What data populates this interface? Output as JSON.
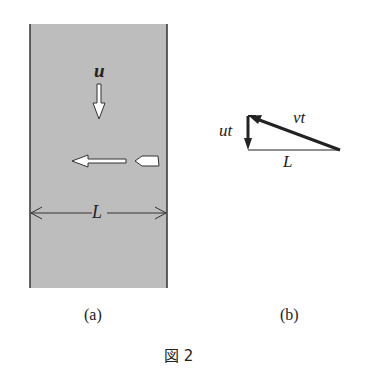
{
  "figure": {
    "caption": "図 2",
    "panel_a": {
      "label": "(a)",
      "current_label": "u",
      "width_label": "L",
      "river_color": "#bdbdbd",
      "edge_color": "#333333"
    },
    "panel_b": {
      "label": "(b)",
      "vertical_label": "ut",
      "hypotenuse_label": "vt",
      "base_label": "L"
    }
  }
}
